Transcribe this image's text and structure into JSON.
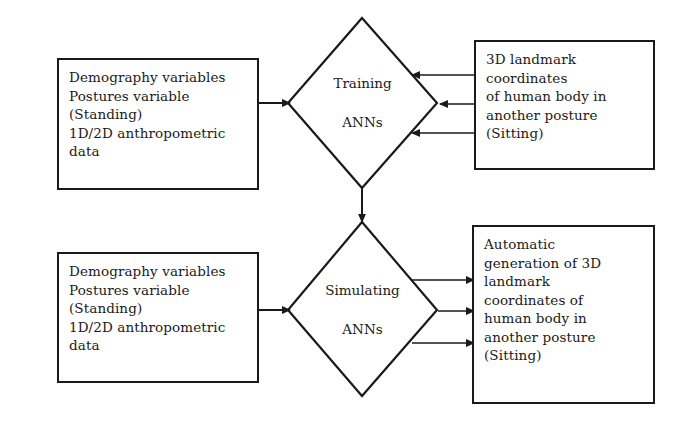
{
  "diagram": {
    "stroke_color": "#1a1a1a",
    "background_color": "#ffffff",
    "nodes": {
      "train_inputs": {
        "shape": "rectangle",
        "text": "Demography variables\nPostures variable\n(Standing)\n1D/2D anthropometric\ndata"
      },
      "train_targets": {
        "shape": "rectangle",
        "text": "3D landmark\ncoordinates\nof human body in\nanother posture\n(Sitting)"
      },
      "training_process": {
        "shape": "diamond",
        "line1": "Training",
        "line2": "ANNs"
      },
      "sim_inputs": {
        "shape": "rectangle",
        "text": "Demography variables\nPostures variable\n(Standing)\n1D/2D anthropometric\ndata"
      },
      "simulating_process": {
        "shape": "diamond",
        "line1": "Simulating",
        "line2": "ANNs"
      },
      "sim_outputs": {
        "shape": "rectangle",
        "text": "Automatic\ngeneration of 3D\nlandmark\ncoordinates of\nhuman body in\nanother posture\n(Sitting)"
      }
    },
    "edges": [
      {
        "name": "train-inputs-to-training",
        "from": "train_inputs",
        "to": "training_process",
        "direction": "right"
      },
      {
        "name": "train-targets-to-training-upper",
        "from": "train_targets",
        "to": "training_process",
        "direction": "left"
      },
      {
        "name": "train-targets-to-training-middle",
        "from": "train_targets",
        "to": "training_process",
        "direction": "left"
      },
      {
        "name": "train-targets-to-training-lower",
        "from": "train_targets",
        "to": "training_process",
        "direction": "left"
      },
      {
        "name": "training-to-simulating",
        "from": "training_process",
        "to": "simulating_process",
        "direction": "down"
      },
      {
        "name": "sim-inputs-to-simulating",
        "from": "sim_inputs",
        "to": "simulating_process",
        "direction": "right"
      },
      {
        "name": "simulating-to-outputs-upper",
        "from": "simulating_process",
        "to": "sim_outputs",
        "direction": "right"
      },
      {
        "name": "simulating-to-outputs-middle",
        "from": "simulating_process",
        "to": "sim_outputs",
        "direction": "right"
      },
      {
        "name": "simulating-to-outputs-lower",
        "from": "simulating_process",
        "to": "sim_outputs",
        "direction": "right"
      }
    ]
  }
}
